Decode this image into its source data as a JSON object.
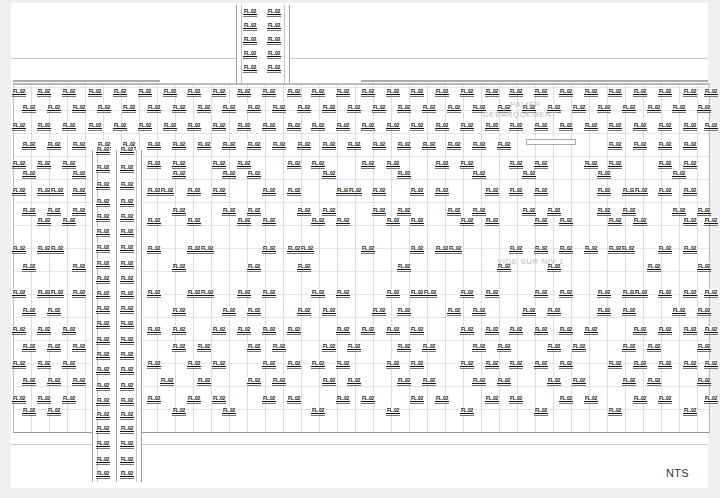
{
  "drawing": {
    "tag_label": "FL.02",
    "scale_note": "NTS",
    "annotations": {
      "landing": "PALIER",
      "landing_sub": "DEBARQUEMENT",
      "void": "VIDE SUR NIV 1"
    },
    "colors": {
      "background": "#efefef",
      "sheet": "#ffffff",
      "tag_text": "#111111",
      "line": "#c8c8c8"
    },
    "tag_rows": [
      {
        "y": 88,
        "xs": [
          12,
          37,
          62,
          88,
          113,
          138,
          163,
          187,
          212,
          237,
          262,
          287,
          311,
          336,
          361,
          386,
          410,
          435,
          460,
          485,
          509,
          534,
          559,
          584,
          608,
          633,
          658,
          683,
          704
        ]
      },
      {
        "y": 104,
        "xs": [
          22,
          47,
          72,
          97,
          122,
          147,
          172,
          197,
          222,
          247,
          272,
          297,
          322,
          347,
          372,
          397,
          422,
          447,
          472,
          497,
          522,
          547,
          572,
          597,
          622,
          647,
          672,
          697
        ]
      },
      {
        "y": 122,
        "xs": [
          12,
          37,
          62,
          88,
          113,
          138,
          163,
          187,
          212,
          237,
          262,
          287,
          311,
          336,
          361,
          386,
          410,
          435,
          460,
          485,
          509,
          534,
          559,
          584,
          608,
          633,
          658,
          683,
          704
        ]
      },
      {
        "y": 141,
        "xs": [
          22,
          47,
          72,
          97,
          122,
          147,
          172,
          197,
          222,
          247,
          272,
          297,
          322,
          347,
          372,
          397,
          422,
          447,
          472,
          497,
          608,
          633,
          658,
          683
        ]
      },
      {
        "y": 160,
        "xs": [
          12,
          37,
          62,
          147,
          172,
          212,
          237,
          287,
          311,
          361,
          386,
          435,
          460,
          509,
          534,
          584,
          608,
          658,
          683
        ]
      },
      {
        "y": 170,
        "xs": [
          22,
          72,
          172,
          222,
          247,
          322,
          397,
          472,
          522,
          597,
          672
        ]
      },
      {
        "y": 187,
        "xs": [
          12,
          37,
          50,
          72,
          147,
          160,
          187,
          212,
          262,
          287,
          336,
          348,
          372,
          410,
          435,
          485,
          509,
          534,
          597,
          622,
          634,
          658,
          683
        ]
      },
      {
        "y": 207,
        "xs": [
          22,
          47,
          72,
          172,
          222,
          247,
          297,
          322,
          372,
          397,
          447,
          472,
          522,
          547,
          597,
          622,
          672,
          697
        ]
      },
      {
        "y": 217,
        "xs": [
          37,
          62,
          147,
          187,
          237,
          262,
          311,
          336,
          386,
          410,
          460,
          485,
          534,
          559,
          608,
          633,
          683,
          704
        ]
      },
      {
        "y": 245,
        "xs": [
          12,
          37,
          50,
          147,
          187,
          200,
          262,
          287,
          300,
          361,
          410,
          435,
          448,
          509,
          534,
          559,
          584,
          608,
          621,
          658,
          683
        ]
      },
      {
        "y": 263,
        "xs": [
          22,
          72,
          172,
          247,
          297,
          397,
          497,
          547,
          647,
          697
        ]
      },
      {
        "y": 289,
        "xs": [
          12,
          37,
          50,
          72,
          147,
          187,
          200,
          237,
          262,
          311,
          336,
          386,
          410,
          423,
          460,
          485,
          534,
          559,
          597,
          622,
          634,
          658,
          683,
          704
        ]
      },
      {
        "y": 307,
        "xs": [
          22,
          47,
          172,
          222,
          247,
          297,
          322,
          372,
          397,
          447,
          472,
          522,
          547,
          597,
          622,
          672,
          697
        ]
      },
      {
        "y": 326,
        "xs": [
          12,
          37,
          62,
          147,
          172,
          212,
          237,
          262,
          287,
          336,
          361,
          386,
          410,
          460,
          485,
          509,
          534,
          559,
          584,
          633,
          658,
          683,
          704
        ]
      },
      {
        "y": 343,
        "xs": [
          22,
          47,
          72,
          172,
          197,
          247,
          272,
          322,
          347,
          397,
          422,
          472,
          497,
          547,
          572,
          622,
          647,
          697
        ]
      },
      {
        "y": 360,
        "xs": [
          12,
          37,
          62,
          147,
          187,
          212,
          262,
          287,
          311,
          336,
          386,
          410,
          460,
          485,
          509,
          534,
          559,
          608,
          633,
          658,
          683,
          704
        ]
      },
      {
        "y": 377,
        "xs": [
          22,
          47,
          72,
          160,
          197,
          247,
          272,
          322,
          347,
          397,
          422,
          472,
          497,
          547,
          572,
          622,
          647,
          697
        ]
      },
      {
        "y": 395,
        "xs": [
          12,
          37,
          62,
          147,
          187,
          212,
          262,
          287,
          336,
          361,
          410,
          435,
          485,
          509,
          559,
          584,
          633,
          658,
          704
        ]
      },
      {
        "y": 407,
        "xs": [
          22,
          47,
          172,
          222,
          311,
          386,
          460,
          534,
          608,
          683
        ]
      }
    ],
    "stair_top_tags": [
      {
        "x": 243,
        "y": 8
      },
      {
        "x": 267,
        "y": 8
      },
      {
        "x": 243,
        "y": 22
      },
      {
        "x": 267,
        "y": 22
      },
      {
        "x": 243,
        "y": 36
      },
      {
        "x": 267,
        "y": 36
      },
      {
        "x": 243,
        "y": 50
      },
      {
        "x": 267,
        "y": 50
      },
      {
        "x": 243,
        "y": 64
      },
      {
        "x": 267,
        "y": 64
      }
    ],
    "stair_left_tags_ys": [
      146,
      164,
      181,
      198,
      213,
      228,
      244,
      260,
      275,
      290,
      305,
      320,
      336,
      351,
      366,
      382,
      397,
      411,
      425,
      440,
      456,
      470
    ]
  }
}
